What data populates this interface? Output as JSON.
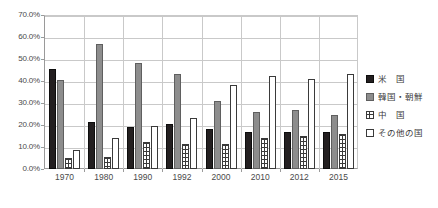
{
  "chart_data": {
    "type": "bar",
    "title": "",
    "xlabel": "",
    "ylabel": "",
    "ylim": [
      0,
      70
    ],
    "grid": true,
    "legend_position": "right",
    "y_ticks": [
      "70.0%",
      "60.0%",
      "50.0%",
      "40.0%",
      "30.0%",
      "20.0%",
      "10.0%",
      "0.0%"
    ],
    "y_tick_values": [
      70,
      60,
      50,
      40,
      30,
      20,
      10,
      0
    ],
    "categories": [
      "1970",
      "1980",
      "1990",
      "1992",
      "2000",
      "2010",
      "2012",
      "2015"
    ],
    "series": [
      {
        "name": "米　国",
        "key": "us",
        "color": "#231f20",
        "pattern": "solid-black",
        "values": [
          45.5,
          21.5,
          19.0,
          20.5,
          18.0,
          17.0,
          17.0,
          17.0
        ]
      },
      {
        "name": "韓国・朝鮮",
        "key": "kr",
        "color": "#8d8d8d",
        "pattern": "solid-gray",
        "values": [
          40.5,
          57.0,
          48.0,
          43.0,
          31.0,
          26.0,
          27.0,
          24.5
        ]
      },
      {
        "name": "中　国",
        "key": "cn",
        "color": "#ffffff",
        "pattern": "grid-hatch",
        "values": [
          5.0,
          5.5,
          12.5,
          11.5,
          11.5,
          14.0,
          15.0,
          16.0
        ]
      },
      {
        "name": "その他の国",
        "key": "other",
        "color": "#ffffff",
        "pattern": "open",
        "values": [
          8.5,
          14.0,
          19.5,
          23.0,
          38.0,
          42.5,
          41.0,
          43.0
        ]
      }
    ]
  },
  "legend": {
    "items": [
      {
        "label": "米　国",
        "swatch": "s-us"
      },
      {
        "label": "韓国・朝鮮",
        "swatch": "s-kr"
      },
      {
        "label": "中　国",
        "swatch": "s-cn"
      },
      {
        "label": "その他の国",
        "swatch": "s-other"
      }
    ]
  }
}
